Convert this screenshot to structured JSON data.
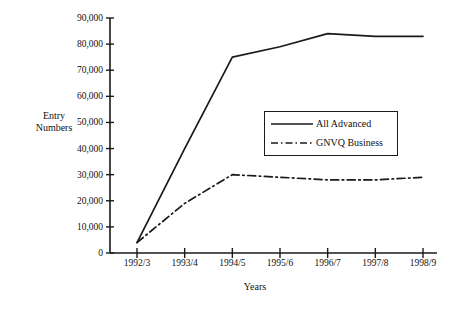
{
  "chart_data": {
    "type": "line",
    "title": "",
    "xlabel": "Years",
    "ylabel": "Entry Numbers",
    "ylabel_lines": [
      "Entry",
      "Numbers"
    ],
    "categories": [
      "1992/3",
      "1993/4",
      "1994/5",
      "1995/6",
      "1996/7",
      "1997/8",
      "1998/9"
    ],
    "ylim": [
      0,
      90000
    ],
    "ytick_values": [
      0,
      10000,
      20000,
      30000,
      40000,
      50000,
      60000,
      70000,
      80000,
      90000
    ],
    "ytick_labels": [
      "0",
      "10,000",
      "20,000",
      "30,000",
      "40,000",
      "50,000",
      "60,000",
      "70,000",
      "80,000",
      "90,000"
    ],
    "grid": false,
    "legend_position": "center-right",
    "series": [
      {
        "name": "All Advanced",
        "style": "solid",
        "color": "#1a1a1a",
        "values": [
          4000,
          40000,
          75000,
          79000,
          84000,
          83000,
          83000
        ]
      },
      {
        "name": "GNVQ Business",
        "style": "dash-dot",
        "color": "#1a1a1a",
        "values": [
          4000,
          19000,
          30000,
          29000,
          28000,
          28000,
          29000
        ]
      }
    ]
  },
  "legend": {
    "entries": [
      {
        "label": "All Advanced"
      },
      {
        "label": "GNVQ Business"
      }
    ]
  }
}
